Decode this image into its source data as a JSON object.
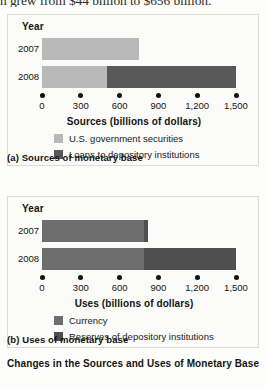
{
  "running_text": "n grew from $44 billion to $656 billion.",
  "figure_title": "Changes in the Sources and Uses of Monetary Base",
  "colors": {
    "light_gray": "#b9b9b9",
    "dark_gray": "#595959",
    "medium_gray": "#6e6e6e",
    "panel_bg": "#fbfbf9",
    "text": "#141414"
  },
  "panels": [
    {
      "key": "a",
      "year_header": "Year",
      "axis_title": "Sources (billions of dollars)",
      "caption": "(a) Sources of monetary base",
      "axis": {
        "min": 0,
        "max": 1500,
        "ticks": [
          0,
          300,
          600,
          900,
          1200,
          1500
        ],
        "tick_labels": [
          "0",
          "300",
          "600",
          "900",
          "1,200",
          "1,500"
        ]
      },
      "legend": [
        {
          "label": "U.S. government securities",
          "color": "#b9b9b9"
        },
        {
          "label": "Loans to depository institutions",
          "color": "#595959"
        }
      ],
      "rows": [
        {
          "year": "2007",
          "segments": [
            {
              "series": "U.S. government securities",
              "value": 750,
              "color": "#b9b9b9"
            }
          ],
          "total": 750
        },
        {
          "year": "2008",
          "segments": [
            {
              "series": "U.S. government securities",
              "value": 500,
              "color": "#b9b9b9"
            },
            {
              "series": "Loans to depository institutions",
              "value": 1000,
              "color": "#595959"
            }
          ],
          "total": 1500
        }
      ]
    },
    {
      "key": "b",
      "year_header": "Year",
      "axis_title": "Uses (billions of dollars)",
      "caption": "(b) Uses of monetary base",
      "axis": {
        "min": 0,
        "max": 1500,
        "ticks": [
          0,
          300,
          600,
          900,
          1200,
          1500
        ],
        "tick_labels": [
          "0",
          "300",
          "600",
          "900",
          "1,200",
          "1,500"
        ]
      },
      "legend": [
        {
          "label": "Currency",
          "color": "#6e6e6e"
        },
        {
          "label": "Reserves of depository institutions",
          "color": "#4f4f4f"
        }
      ],
      "rows": [
        {
          "year": "2007",
          "segments": [
            {
              "series": "Currency",
              "value": 790,
              "color": "#6e6e6e"
            },
            {
              "series": "Reserves of depository institutions",
              "value": 30,
              "color": "#4f4f4f"
            }
          ],
          "total": 820
        },
        {
          "year": "2008",
          "segments": [
            {
              "series": "Currency",
              "value": 790,
              "color": "#6e6e6e"
            },
            {
              "series": "Reserves of depository institutions",
              "value": 710,
              "color": "#4f4f4f"
            }
          ],
          "total": 1500
        }
      ]
    }
  ],
  "chart_data": [
    {
      "type": "bar",
      "orientation": "horizontal",
      "stacked": true,
      "title": "(a) Sources of monetary base",
      "xlabel": "Sources (billions of dollars)",
      "ylabel": "Year",
      "categories": [
        "2007",
        "2008"
      ],
      "series": [
        {
          "name": "U.S. government securities",
          "values": [
            750,
            500
          ],
          "color": "#b9b9b9"
        },
        {
          "name": "Loans to depository institutions",
          "values": [
            0,
            1000
          ],
          "color": "#595959"
        }
      ],
      "xlim": [
        0,
        1500
      ],
      "xticks": [
        0,
        300,
        600,
        900,
        1200,
        1500
      ],
      "xticklabels": [
        "0",
        "300",
        "600",
        "900",
        "1,200",
        "1,500"
      ],
      "grid": false,
      "legend_position": "below"
    },
    {
      "type": "bar",
      "orientation": "horizontal",
      "stacked": true,
      "title": "(b) Uses of monetary base",
      "xlabel": "Uses (billions of dollars)",
      "ylabel": "Year",
      "categories": [
        "2007",
        "2008"
      ],
      "series": [
        {
          "name": "Currency",
          "values": [
            790,
            790
          ],
          "color": "#6e6e6e"
        },
        {
          "name": "Reserves of depository institutions",
          "values": [
            30,
            710
          ],
          "color": "#4f4f4f"
        }
      ],
      "xlim": [
        0,
        1500
      ],
      "xticks": [
        0,
        300,
        600,
        900,
        1200,
        1500
      ],
      "xticklabels": [
        "0",
        "300",
        "600",
        "900",
        "1,200",
        "1,500"
      ],
      "grid": false,
      "legend_position": "below"
    }
  ]
}
